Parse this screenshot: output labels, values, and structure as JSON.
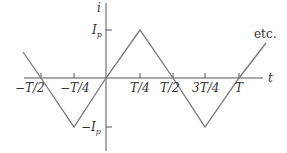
{
  "diagram": {
    "type": "waveform",
    "colors": {
      "axis": "#555555",
      "waveform": "#777777",
      "text": "#333333",
      "background": "#ffffff"
    },
    "y_axis": {
      "label": "i",
      "ticks": [
        {
          "label": "I",
          "sub": "p",
          "value": "Ip"
        },
        {
          "label": "−I",
          "sub": "p",
          "value": "-Ip"
        }
      ]
    },
    "x_axis": {
      "label": "t",
      "ticks": [
        {
          "label": "−T/2",
          "value": "-T/2"
        },
        {
          "label": "−T/4",
          "value": "-T/4"
        },
        {
          "label": "T/4",
          "value": "T/4"
        },
        {
          "label": "T/2",
          "value": "T/2"
        },
        {
          "label": "3T/4",
          "value": "3T/4"
        },
        {
          "label": "T",
          "value": "T"
        }
      ]
    },
    "annotation": "etc.",
    "waveform_points": [
      {
        "t": "-0.6T",
        "i": "0.4Ip"
      },
      {
        "t": "-T/2",
        "i": "0"
      },
      {
        "t": "-T/4",
        "i": "-Ip"
      },
      {
        "t": "0",
        "i": "0"
      },
      {
        "t": "T/4",
        "i": "Ip"
      },
      {
        "t": "T/2",
        "i": "0"
      },
      {
        "t": "3T/4",
        "i": "-Ip"
      },
      {
        "t": "T",
        "i": "0"
      },
      {
        "t": "1.2T",
        "i": "0.75Ip"
      }
    ]
  }
}
